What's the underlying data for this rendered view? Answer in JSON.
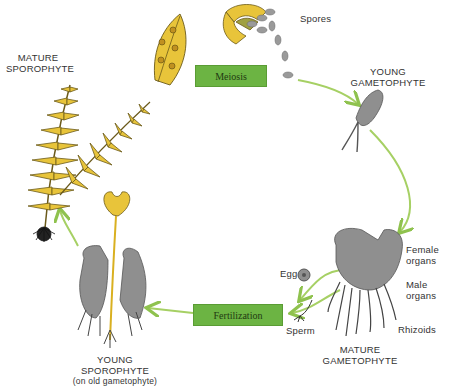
{
  "diagram": {
    "colors": {
      "frond": "#e8c43a",
      "frond_outline": "#6b5a1a",
      "gametophyte": "#8f8f8f",
      "arrow": "#9ccc5a",
      "stage_box": "#6cb443",
      "spore": "#9a9a9a",
      "text": "#333333"
    },
    "stages": {
      "mature_sporophyte": {
        "line1": "MATURE",
        "line2": "SPOROPHYTE"
      },
      "young_gametophyte": {
        "line1": "YOUNG",
        "line2": "GAMETOPHYTE"
      },
      "mature_gametophyte": {
        "line1": "MATURE",
        "line2": "GAMETOPHYTE"
      },
      "young_sporophyte": {
        "line1": "YOUNG",
        "line2": "SPOROPHYTE",
        "line3": "(on old gametophyte)"
      }
    },
    "processes": {
      "meiosis": "Meiosis",
      "fertilization": "Fertilization"
    },
    "parts": {
      "spores": "Spores",
      "female_organs_1": "Female",
      "female_organs_2": "organs",
      "male_organs_1": "Male",
      "male_organs_2": "organs",
      "rhizoids": "Rhizoids",
      "egg": "Egg",
      "sperm": "Sperm"
    }
  }
}
